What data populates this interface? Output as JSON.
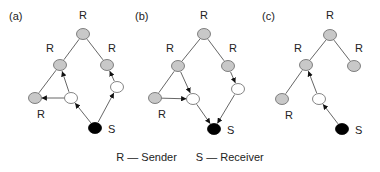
{
  "legend": {
    "sender": "R — Sender",
    "receiver": "S — Receiver"
  },
  "panels": [
    {
      "label": "(a)",
      "label_pos": [
        9,
        20
      ],
      "nodes": [
        {
          "id": "top",
          "x": 83,
          "y": 34,
          "type": "grey",
          "text": "R",
          "tx": 79,
          "ty": 19
        },
        {
          "id": "lm",
          "x": 60,
          "y": 65,
          "type": "grey",
          "text": "R",
          "tx": 46,
          "ty": 52
        },
        {
          "id": "rm",
          "x": 107,
          "y": 65,
          "type": "grey",
          "text": "R",
          "tx": 108,
          "ty": 52
        },
        {
          "id": "bl",
          "x": 35,
          "y": 98,
          "type": "grey",
          "text": "R",
          "tx": 37,
          "ty": 118
        },
        {
          "id": "wl",
          "x": 71,
          "y": 98,
          "type": "white"
        },
        {
          "id": "wr",
          "x": 117,
          "y": 87,
          "type": "white"
        },
        {
          "id": "s",
          "x": 95,
          "y": 128,
          "type": "black",
          "text": "S",
          "tx": 108,
          "ty": 133
        }
      ],
      "edges": [
        {
          "from": "top",
          "to": "lm",
          "arrow": false
        },
        {
          "from": "top",
          "to": "rm",
          "arrow": false
        },
        {
          "from": "lm",
          "to": "bl",
          "arrow": false
        },
        {
          "from": "wl",
          "to": "lm",
          "arrow": true
        },
        {
          "from": "wl",
          "to": "bl",
          "arrow": true
        },
        {
          "from": "s",
          "to": "wl",
          "arrow": true
        },
        {
          "from": "s",
          "to": "wr",
          "arrow": true
        },
        {
          "from": "wr",
          "to": "rm",
          "arrow": true
        }
      ]
    },
    {
      "label": "(b)",
      "label_pos": [
        135,
        20
      ],
      "nodes": [
        {
          "id": "top",
          "x": 204,
          "y": 34,
          "type": "grey",
          "text": "R",
          "tx": 200,
          "ty": 19
        },
        {
          "id": "lm",
          "x": 178,
          "y": 66,
          "type": "grey",
          "text": "R",
          "tx": 166,
          "ty": 52
        },
        {
          "id": "rm",
          "x": 228,
          "y": 66,
          "type": "grey",
          "text": "R",
          "tx": 229,
          "ty": 52
        },
        {
          "id": "bl",
          "x": 155,
          "y": 98,
          "type": "grey",
          "text": "R",
          "tx": 158,
          "ty": 118
        },
        {
          "id": "wl",
          "x": 193,
          "y": 99,
          "type": "white"
        },
        {
          "id": "wr",
          "x": 238,
          "y": 89,
          "type": "white"
        },
        {
          "id": "s",
          "x": 214,
          "y": 129,
          "type": "black",
          "text": "S",
          "tx": 227,
          "ty": 134
        }
      ],
      "edges": [
        {
          "from": "top",
          "to": "lm",
          "arrow": false
        },
        {
          "from": "top",
          "to": "rm",
          "arrow": false
        },
        {
          "from": "lm",
          "to": "bl",
          "arrow": false
        },
        {
          "from": "lm",
          "to": "wl",
          "arrow": true
        },
        {
          "from": "bl",
          "to": "wl",
          "arrow": true
        },
        {
          "from": "wl",
          "to": "s",
          "arrow": true
        },
        {
          "from": "rm",
          "to": "wr",
          "arrow": true
        },
        {
          "from": "wr",
          "to": "s",
          "arrow": true
        }
      ]
    },
    {
      "label": "(c)",
      "label_pos": [
        262,
        20
      ],
      "nodes": [
        {
          "id": "top",
          "x": 330,
          "y": 35,
          "type": "grey",
          "text": "R",
          "tx": 326,
          "ty": 19
        },
        {
          "id": "lm",
          "x": 306,
          "y": 65,
          "type": "grey",
          "text": "R",
          "tx": 294,
          "ty": 52
        },
        {
          "id": "rm",
          "x": 354,
          "y": 66,
          "type": "grey",
          "text": "R",
          "tx": 355,
          "ty": 52
        },
        {
          "id": "bl",
          "x": 282,
          "y": 99,
          "type": "grey",
          "text": "R",
          "tx": 285,
          "ty": 119
        },
        {
          "id": "wl",
          "x": 319,
          "y": 99,
          "type": "white"
        },
        {
          "id": "s",
          "x": 342,
          "y": 129,
          "type": "black",
          "text": "S",
          "tx": 355,
          "ty": 134
        }
      ],
      "edges": [
        {
          "from": "top",
          "to": "lm",
          "arrow": false
        },
        {
          "from": "top",
          "to": "rm",
          "arrow": false
        },
        {
          "from": "lm",
          "to": "bl",
          "arrow": false
        },
        {
          "from": "wl",
          "to": "lm",
          "arrow": true
        },
        {
          "from": "s",
          "to": "wl",
          "arrow": true
        }
      ]
    }
  ]
}
